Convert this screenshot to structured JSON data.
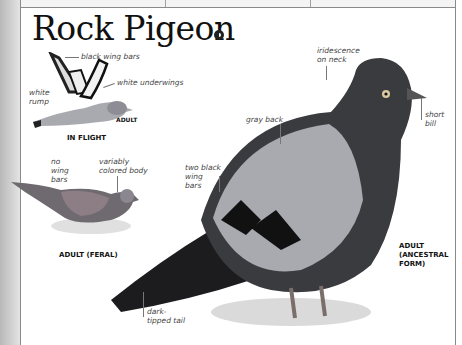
{
  "page": {
    "title": "Rock Pigeon",
    "sound_icon": "speaker-icon",
    "header_cells": [
      "",
      "",
      ""
    ]
  },
  "flight_figure": {
    "caption": "IN FLIGHT",
    "age_tag": "ADULT",
    "labels": {
      "black_wing_bars": "black wing bars",
      "white_underwings": "white underwings",
      "white_rump": "white rump"
    }
  },
  "feral_figure": {
    "caption": "ADULT (FERAL)",
    "labels": {
      "no_wing_bars": "no wing bars",
      "variably_colored_body": "variably colored body"
    }
  },
  "main_figure": {
    "caption_line1": "ADULT",
    "caption_line2": "(ANCESTRAL",
    "caption_line3": "FORM)",
    "labels": {
      "iridescence": "iridescence on neck",
      "short_bill": "short bill",
      "gray_back": "gray back",
      "two_black_wing_bars": "two black wing bars",
      "dark_tipped_tail": "dark-tipped tail"
    }
  },
  "colors": {
    "border": "#8a8a8a",
    "text": "#111111",
    "label_text": "#444444",
    "pigeon_gray": "#a9aab0",
    "pigeon_dark": "#2a2b2e"
  }
}
